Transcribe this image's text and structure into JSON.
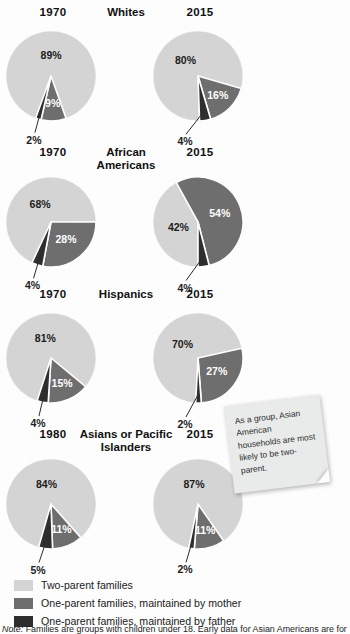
{
  "colors": {
    "two_parent": "#d4d4d4",
    "mother": "#6e6e6e",
    "father": "#2e2e2e",
    "background": "#fdfdfd"
  },
  "legend": {
    "items": [
      {
        "label": "Two-parent families",
        "color": "#d4d4d4"
      },
      {
        "label": "One-parent families, maintained by mother",
        "color": "#6e6e6e"
      },
      {
        "label": "One-parent families, maintained by father",
        "color": "#2e2e2e"
      }
    ]
  },
  "callout": {
    "text": "As a group, Asian American households are most likely to be two-parent."
  },
  "footnote": {
    "prefix": "Note:",
    "text": "Families are groups with children under 18. Early data for Asian Americans are for"
  },
  "chart_data": {
    "type": "pie",
    "title": "",
    "categories": [
      "Two-parent families",
      "One-parent families, maintained by mother",
      "One-parent families, maintained by father"
    ],
    "groups": [
      {
        "name": "Whites",
        "charts": [
          {
            "year": "1970",
            "values": [
              89,
              9,
              2
            ],
            "labels": [
              "89%",
              "9%",
              "2%"
            ]
          },
          {
            "year": "2015",
            "values": [
              80,
              16,
              4
            ],
            "labels": [
              "80%",
              "16%",
              "4%"
            ]
          }
        ]
      },
      {
        "name": "African Americans",
        "charts": [
          {
            "year": "1970",
            "values": [
              68,
              28,
              4
            ],
            "labels": [
              "68%",
              "28%",
              "4%"
            ]
          },
          {
            "year": "2015",
            "values": [
              42,
              54,
              4
            ],
            "labels": [
              "42%",
              "54%",
              "4%"
            ]
          }
        ]
      },
      {
        "name": "Hispanics",
        "charts": [
          {
            "year": "1970",
            "values": [
              81,
              15,
              4
            ],
            "labels": [
              "81%",
              "15%",
              "4%"
            ]
          },
          {
            "year": "2015",
            "values": [
              70,
              27,
              2
            ],
            "labels": [
              "70%",
              "27%",
              "2%"
            ]
          }
        ]
      },
      {
        "name": "Asians or Pacific Islanders",
        "charts": [
          {
            "year": "1980",
            "values": [
              84,
              11,
              5
            ],
            "labels": [
              "84%",
              "11%",
              "5%"
            ]
          },
          {
            "year": "2015",
            "values": [
              87,
              11,
              2
            ],
            "labels": [
              "87%",
              "11%",
              "2%"
            ]
          }
        ]
      }
    ]
  }
}
